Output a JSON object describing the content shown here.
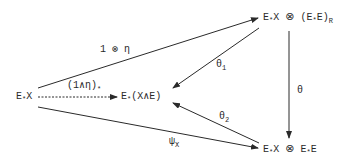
{
  "diagram": {
    "type": "commutative-diagram",
    "nodes": [
      {
        "id": "ExX",
        "label": "E*X",
        "parts": {
          "base": "E",
          "star": "*",
          "rest": "X"
        }
      },
      {
        "id": "E_XsmashE",
        "label": "E*(X∧E)",
        "parts": {
          "base": "E",
          "star": "*",
          "rest": "(X∧E)"
        }
      },
      {
        "id": "top_right",
        "label": "E*X ⊗ (E*E)R",
        "parts": {
          "a_base": "E",
          "a_star": "*",
          "a_rest": "X",
          "op": "⊗",
          "b_open": "(E",
          "b_star": "*",
          "b_rest": "E)",
          "sub": "R"
        }
      },
      {
        "id": "bottom_right",
        "label": "E*X ⊗ E*E",
        "parts": {
          "a_base": "E",
          "a_star": "*",
          "a_rest": "X",
          "op": "⊗",
          "b_base": "E",
          "b_star": "*",
          "b_rest": "E"
        }
      }
    ],
    "edges": [
      {
        "from": "ExX",
        "to": "top_right",
        "label": "1 ⊗ η",
        "style": "solid"
      },
      {
        "from": "ExX",
        "to": "E_XsmashE",
        "label": "(1∧η)*",
        "label_parts": {
          "main": "(1∧η)",
          "sub": "*"
        },
        "style": "dashed"
      },
      {
        "from": "ExX",
        "to": "bottom_right",
        "label": "ψX",
        "label_parts": {
          "main": "ψ",
          "sub": "X"
        },
        "style": "solid"
      },
      {
        "from": "top_right",
        "to": "E_XsmashE",
        "label": "θ1",
        "label_parts": {
          "main": "θ",
          "sub": "1"
        },
        "style": "solid"
      },
      {
        "from": "bottom_right",
        "to": "E_XsmashE",
        "label": "θ2",
        "label_parts": {
          "main": "θ",
          "sub": "2"
        },
        "style": "solid"
      },
      {
        "from": "top_right",
        "to": "bottom_right",
        "label": "θ",
        "style": "solid"
      }
    ],
    "colors": {
      "ink": "#2a2a2a",
      "background": "#ffffff"
    }
  }
}
